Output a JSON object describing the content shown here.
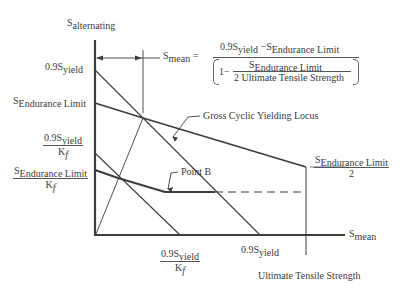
{
  "diagram": {
    "type": "modified-goodman-fatigue-diagram",
    "axes": {
      "y_label": {
        "main": "S",
        "sub": "alternating"
      },
      "x_label": {
        "main": "S",
        "sub": "mean"
      }
    },
    "y_ticks": [
      {
        "id": "y_09sy",
        "main": "0.9S",
        "sub": "yield"
      },
      {
        "id": "y_se",
        "main": "S",
        "sub": "Endurance Limit"
      },
      {
        "id": "y_09sy_kf",
        "num_main": "0.9S",
        "num_sub": "yield",
        "den": "K",
        "den_sub": "f"
      },
      {
        "id": "y_se_kf",
        "num_main": "S",
        "num_sub": "Endurance Limit",
        "den": "K",
        "den_sub": "f"
      }
    ],
    "x_ticks": [
      {
        "id": "x_09sy_kf",
        "num_main": "0.9S",
        "num_sub": "yield",
        "den": "K",
        "den_sub": "f"
      },
      {
        "id": "x_09sy",
        "main": "0.9S",
        "sub": "yield"
      },
      {
        "id": "x_uts",
        "label": "Ultimate Tensile Strength"
      }
    ],
    "right_label": {
      "num_main": "S",
      "num_sub": "Endurance Limit",
      "den": "2"
    },
    "annotations": {
      "gross_locus": "Gross Cyclic Yielding Locus",
      "point_b": "Point B"
    },
    "formula": {
      "lhs_main": "S",
      "lhs_sub": "mean",
      "equals": "=",
      "num_a_main": "0.9S",
      "num_a_sub": "yield",
      "minus": "−",
      "num_b_main": "S",
      "num_b_sub": "Endurance Limit",
      "den_one": "1−",
      "den_inner_num_main": "S",
      "den_inner_num_sub": "Endurance Limit",
      "den_inner_den": "2 Ultimate Tensile Strength"
    },
    "colors": {
      "line": "#3c3c3c",
      "text": "#3a3a3a",
      "background": "#ffffff"
    }
  }
}
